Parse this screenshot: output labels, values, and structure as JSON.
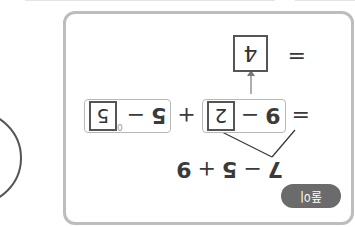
{
  "rotation_deg": 180,
  "badge": {
    "label": "풀이"
  },
  "expression": {
    "terms": [
      "7",
      "−",
      "5",
      "+",
      "9"
    ]
  },
  "step1": {
    "equals": "=",
    "group1": {
      "left": "9",
      "op": "−",
      "box": "2"
    },
    "plus": "+",
    "group2": {
      "left": "5",
      "op": "−",
      "box": "5",
      "superscript": "0"
    }
  },
  "step2": {
    "equals": "=",
    "result_box": "4"
  },
  "colors": {
    "card_border": "#bdbdbd",
    "badge_bg": "#6b6b6b",
    "box_border": "#555555",
    "group_border": "#b8b8b8",
    "text": "#3a3a3a"
  }
}
